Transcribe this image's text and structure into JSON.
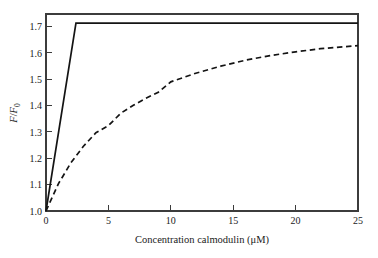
{
  "chart_data": {
    "type": "line",
    "title": "",
    "xlabel": "Concentration calmodulin (μM)",
    "ylabel": "F/F0",
    "ylabel_parts": {
      "numerator": "F",
      "denominator": "F",
      "subscript": "0",
      "separator": "/"
    },
    "xlim": [
      0,
      25
    ],
    "ylim": [
      1.0,
      1.755
    ],
    "grid": false,
    "legend": "none",
    "xticks": [
      0,
      5,
      10,
      15,
      20,
      25
    ],
    "xtick_labels": [
      "0",
      "5",
      "10",
      "15",
      "20",
      "25"
    ],
    "yticks": [
      1.0,
      1.1,
      1.2,
      1.3,
      1.4,
      1.5,
      1.6,
      1.7
    ],
    "ytick_labels": [
      "1.0",
      "1.1",
      "1.2",
      "1.3",
      "1.4",
      "1.5",
      "1.6",
      "1.7"
    ],
    "series": [
      {
        "name": "stoichiometric-binding",
        "style": "solid",
        "color": "#141414",
        "description": "Linear rise to saturation then plateau",
        "x": [
          0,
          2.4,
          5,
          10,
          15,
          20,
          25
        ],
        "values": [
          1.0,
          1.72,
          1.72,
          1.72,
          1.72,
          1.72,
          1.72
        ]
      },
      {
        "name": "hyperbolic-binding",
        "style": "dashed",
        "color": "#141414",
        "description": "Hyperbolic saturation binding curve",
        "x": [
          0,
          1,
          2,
          3,
          4,
          5,
          6,
          7,
          8,
          9,
          10,
          12,
          14,
          16,
          18,
          20,
          22,
          25
        ],
        "values": [
          1.0,
          1.105,
          1.185,
          1.248,
          1.3,
          1.327,
          1.375,
          1.405,
          1.432,
          1.455,
          1.495,
          1.528,
          1.555,
          1.578,
          1.596,
          1.61,
          1.622,
          1.634
        ]
      }
    ],
    "annotations": []
  },
  "figure": {
    "background_color": "#ffffff",
    "axis_color": "#3c3c3c",
    "line_color": "#141414"
  }
}
